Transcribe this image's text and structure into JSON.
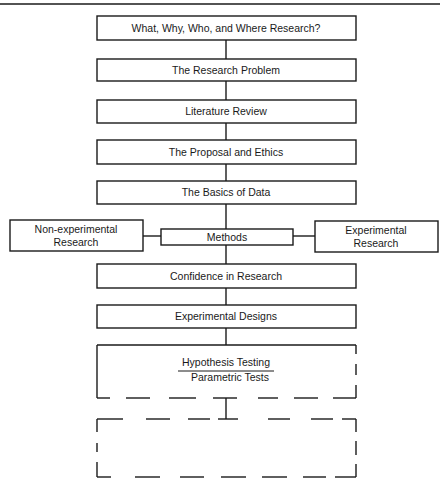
{
  "diagram": {
    "type": "flowchart",
    "steps": [
      {
        "label": "What, Why, Who, and Where Research?"
      },
      {
        "label": "The Research Problem"
      },
      {
        "label": "Literature Review"
      },
      {
        "label": "The Proposal and Ethics"
      },
      {
        "label": "The Basics of Data"
      },
      {
        "label": "Methods"
      },
      {
        "label": "Confidence in Research"
      },
      {
        "label": "Experimental Designs"
      }
    ],
    "methods_branches": {
      "left": {
        "line1": "Non-experimental",
        "line2": "Research"
      },
      "right": {
        "line1": "Experimental",
        "line2": "Research"
      }
    },
    "current_section": {
      "title": "Hypothesis Testing",
      "subtitle": "Parametric Tests"
    },
    "next_section": {
      "label": ""
    },
    "colors": {
      "stroke": "#1a1a1a",
      "background": "#ffffff"
    }
  }
}
